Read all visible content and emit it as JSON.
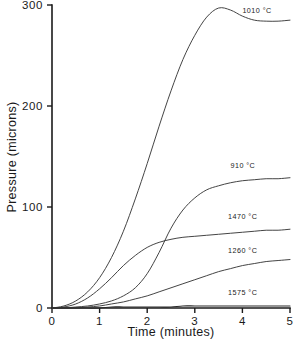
{
  "chart_data": {
    "type": "line",
    "title": "",
    "xlabel": "Time (minutes)",
    "ylabel": "Pressure (microns)",
    "xlim": [
      0,
      5
    ],
    "ylim": [
      0,
      300
    ],
    "xticks": [
      "0",
      "1",
      "2",
      "3",
      "4",
      "5"
    ],
    "yticks": [
      "0",
      "100",
      "200",
      "300"
    ],
    "grid": false,
    "legend_position": "inline-right-of-curve",
    "x": [
      0,
      0.25,
      0.5,
      0.75,
      1.0,
      1.25,
      1.5,
      1.75,
      2.0,
      2.25,
      2.5,
      2.75,
      3.0,
      3.25,
      3.5,
      3.75,
      4.0,
      4.25,
      4.5,
      4.75,
      5.0
    ],
    "series": [
      {
        "name": "1010 °C",
        "label": "1010 °C",
        "label_x": 4.0,
        "label_y": 292,
        "values": [
          0,
          2,
          7,
          16,
          30,
          50,
          76,
          108,
          143,
          180,
          215,
          246,
          270,
          288,
          297,
          295,
          289,
          285,
          284,
          284,
          285
        ]
      },
      {
        "name": "910 °C",
        "label": "910 °C",
        "label_x": 3.75,
        "label_y": 139,
        "values": [
          0,
          0,
          1,
          2,
          4,
          7,
          12,
          20,
          34,
          55,
          79,
          97,
          109,
          117,
          121,
          124,
          126,
          127,
          128,
          128,
          129
        ]
      },
      {
        "name": "1470 °C",
        "label": "1470 °C",
        "label_x": 3.7,
        "label_y": 88,
        "values": [
          0,
          1,
          4,
          10,
          19,
          30,
          42,
          52,
          60,
          65,
          68,
          70,
          71,
          72,
          73,
          74,
          75,
          76,
          77,
          77,
          78
        ]
      },
      {
        "name": "1260 °C",
        "label": "1260 °C",
        "label_x": 3.7,
        "label_y": 54,
        "values": [
          0,
          0,
          0,
          1,
          2,
          4,
          6,
          9,
          12,
          16,
          20,
          24,
          28,
          32,
          36,
          39,
          42,
          44,
          46,
          47,
          48
        ]
      },
      {
        "name": "1575 °C",
        "label": "1575 °C",
        "label_x": 3.7,
        "label_y": 13,
        "values": [
          0,
          0,
          0,
          0,
          0,
          1,
          1,
          1,
          1,
          1,
          1,
          2,
          2,
          2,
          2,
          2,
          2,
          2,
          2,
          2,
          2
        ]
      }
    ]
  }
}
